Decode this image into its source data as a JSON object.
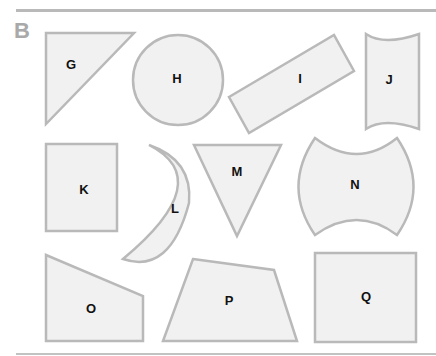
{
  "section": {
    "label": "B"
  },
  "colors": {
    "shape_fill": "#f1f1f1",
    "shape_stroke": "#b9b9b9",
    "label": "#111111",
    "section_label": "#a9a9a9",
    "rule": "#b9b9b9"
  },
  "shapes": [
    {
      "id": "G",
      "label": "G",
      "type": "right-triangle"
    },
    {
      "id": "H",
      "label": "H",
      "type": "circle"
    },
    {
      "id": "I",
      "label": "I",
      "type": "rotated-rectangle"
    },
    {
      "id": "J",
      "label": "J",
      "type": "concave-top-bottom-rectangle"
    },
    {
      "id": "K",
      "label": "K",
      "type": "rectangle"
    },
    {
      "id": "L",
      "label": "L",
      "type": "crescent"
    },
    {
      "id": "M",
      "label": "M",
      "type": "inverted-triangle"
    },
    {
      "id": "N",
      "label": "N",
      "type": "concave-top-bottom-convex-sides"
    },
    {
      "id": "O",
      "label": "O",
      "type": "right-trapezoid"
    },
    {
      "id": "P",
      "label": "P",
      "type": "irregular-quadrilateral"
    },
    {
      "id": "Q",
      "label": "Q",
      "type": "square"
    }
  ]
}
